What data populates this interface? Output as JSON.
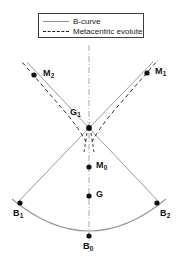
{
  "figure": {
    "width": 178,
    "height": 267,
    "background": "#ffffff"
  },
  "legend": {
    "position": "top-center",
    "border_color": "#3c3c3c",
    "entries": [
      {
        "label": "B-curve",
        "style": "solid",
        "color": "#8c8c8c",
        "key_name": "solid-line-key"
      },
      {
        "label": "Metacentric evolute",
        "style": "dashed",
        "color": "#1e1e1e",
        "key_name": "dashed-line-key"
      }
    ]
  },
  "axis": {
    "centerline": {
      "name": "vertical-centerline",
      "style": "dash-dot",
      "color": "#a8a8a8",
      "x": 89,
      "y_top": 45,
      "y_bottom": 252
    }
  },
  "points": [
    {
      "id": "M2",
      "label": "M",
      "sub": "2",
      "x": 34,
      "y": 75,
      "label_x": 43,
      "label_y": 69
    },
    {
      "id": "M1",
      "label": "M",
      "sub": "1",
      "x": 147,
      "y": 73,
      "label_x": 155,
      "label_y": 67
    },
    {
      "id": "G1",
      "label": "G",
      "sub": "1",
      "x": 89,
      "y": 128,
      "label_x": 70,
      "label_y": 108
    },
    {
      "id": "M0",
      "label": "M",
      "sub": "0",
      "x": 89,
      "y": 167,
      "label_x": 96,
      "label_y": 161
    },
    {
      "id": "G",
      "label": "G",
      "sub": "",
      "x": 89,
      "y": 196,
      "label_x": 96,
      "label_y": 190
    },
    {
      "id": "B1",
      "label": "B",
      "sub": "1",
      "x": 20,
      "y": 203,
      "label_x": 13,
      "label_y": 209
    },
    {
      "id": "B2",
      "label": "B",
      "sub": "2",
      "x": 157,
      "y": 203,
      "label_x": 160,
      "label_y": 209
    },
    {
      "id": "B0",
      "label": "B",
      "sub": "0",
      "x": 89,
      "y": 236,
      "label_x": 83,
      "label_y": 242
    }
  ],
  "colors": {
    "curve": "#9a9a9a",
    "evolute": "#2b2b2b",
    "point": "#101010",
    "text": "#141414",
    "centerline": "#a8a8a8"
  },
  "geometry": {
    "b_curve_note": "arc through B1, B0, B2",
    "radius_lines": "G1 to B1 and G1 to B2",
    "evolute_branches": "cusp at G1 extending up-left to M2 and up-right to M1"
  }
}
